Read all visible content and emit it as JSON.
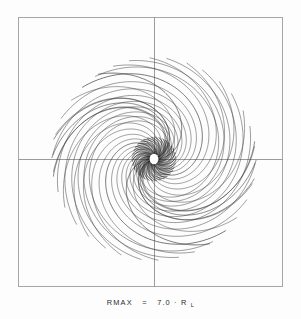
{
  "figure": {
    "caption": {
      "label": "RMAX",
      "equals": "=",
      "value": "7.0",
      "times": "·",
      "unit_base": "R",
      "unit_sub": "L",
      "full_text": "RMAX = 7.0·R_L"
    },
    "colors": {
      "background": "#fdfdfd",
      "frame": "#9a9a9a",
      "axis": "#8e8e8e",
      "curve": "#3a3a3a",
      "curve_dark": "#111111"
    }
  },
  "chart_data": {
    "type": "line",
    "subtitle": "",
    "xlabel": "",
    "ylabel": "",
    "grid": false,
    "legend": "none",
    "axis_lines": {
      "x_axis_y": 0,
      "y_axis_x": 0,
      "x_range": [
        -8.5,
        8.5
      ],
      "y_range": [
        -8.5,
        8.5
      ]
    },
    "rmax": 7.0,
    "rmax_unit": "R_L",
    "curve_count": 36,
    "series": [
      {
        "name": "spiral-1",
        "phase_deg": 0,
        "rmax": 7.0
      },
      {
        "name": "spiral-2",
        "phase_deg": 10,
        "rmax": 7.0
      },
      {
        "name": "spiral-3",
        "phase_deg": 20,
        "rmax": 7.0
      },
      {
        "name": "spiral-4",
        "phase_deg": 30,
        "rmax": 7.0
      },
      {
        "name": "spiral-5",
        "phase_deg": 40,
        "rmax": 7.0
      },
      {
        "name": "spiral-6",
        "phase_deg": 50,
        "rmax": 7.0
      },
      {
        "name": "spiral-7",
        "phase_deg": 60,
        "rmax": 7.0
      },
      {
        "name": "spiral-8",
        "phase_deg": 70,
        "rmax": 7.0
      },
      {
        "name": "spiral-9",
        "phase_deg": 80,
        "rmax": 7.0
      },
      {
        "name": "spiral-10",
        "phase_deg": 90,
        "rmax": 7.0
      },
      {
        "name": "spiral-11",
        "phase_deg": 100,
        "rmax": 7.0
      },
      {
        "name": "spiral-12",
        "phase_deg": 110,
        "rmax": 7.0
      },
      {
        "name": "spiral-13",
        "phase_deg": 120,
        "rmax": 7.0
      },
      {
        "name": "spiral-14",
        "phase_deg": 130,
        "rmax": 7.0
      },
      {
        "name": "spiral-15",
        "phase_deg": 140,
        "rmax": 7.0
      },
      {
        "name": "spiral-16",
        "phase_deg": 150,
        "rmax": 7.0
      },
      {
        "name": "spiral-17",
        "phase_deg": 160,
        "rmax": 7.0
      },
      {
        "name": "spiral-18",
        "phase_deg": 170,
        "rmax": 7.0
      }
    ]
  },
  "geometry": {
    "frame": {
      "x": 18,
      "y": 17,
      "width": 265,
      "height": 270
    },
    "origin": {
      "x": 154,
      "y": 159
    }
  }
}
